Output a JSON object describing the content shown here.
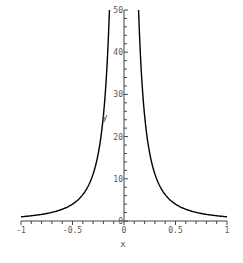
{
  "chart_data": {
    "type": "line",
    "title": "",
    "function": "y = 1/x^2",
    "xlabel": "x",
    "ylabel": "y",
    "xlim": [
      -1,
      1
    ],
    "ylim": [
      0,
      50
    ],
    "x_ticks": [
      {
        "value": -1,
        "label": "-1"
      },
      {
        "value": -0.5,
        "label": "-0.5"
      },
      {
        "value": 0,
        "label": "0"
      },
      {
        "value": 0.5,
        "label": "0.5"
      },
      {
        "value": 1,
        "label": "1"
      }
    ],
    "y_ticks": [
      {
        "value": 0,
        "label": "0"
      },
      {
        "value": 10,
        "label": "10"
      },
      {
        "value": 20,
        "label": "20"
      },
      {
        "value": 30,
        "label": "30"
      },
      {
        "value": 40,
        "label": "40"
      },
      {
        "value": 50,
        "label": "50"
      }
    ],
    "grid": false,
    "legend": null,
    "series": [
      {
        "name": "1/x^2",
        "color": "#000000",
        "x": [
          -1,
          -0.9,
          -0.8,
          -0.7,
          -0.6,
          -0.5,
          -0.4,
          -0.3,
          -0.25,
          -0.2,
          -0.1414,
          0.1414,
          0.2,
          0.25,
          0.3,
          0.4,
          0.5,
          0.6,
          0.7,
          0.8,
          0.9,
          1
        ],
        "y": [
          1,
          1.23,
          1.56,
          2.04,
          2.78,
          4,
          6.25,
          11.11,
          16,
          25,
          50,
          50,
          25,
          16,
          11.11,
          6.25,
          4,
          2.78,
          2.04,
          1.56,
          1.23,
          1
        ]
      }
    ]
  }
}
